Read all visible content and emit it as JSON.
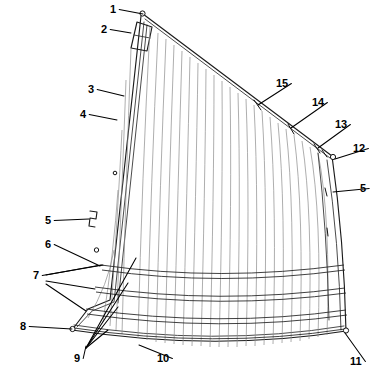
{
  "figure": {
    "kind": "patent-line-drawing",
    "background_color": "#ffffff",
    "line_color": "#1a1a1a",
    "panel_color": "#8b8b8b",
    "width": 387,
    "height": 384
  },
  "callouts": [
    {
      "id": "1",
      "label": "1",
      "x": 110,
      "y": 13,
      "target_x": 143,
      "target_y": 14,
      "anchor": "start"
    },
    {
      "id": "2",
      "label": "2",
      "x": 101,
      "y": 33,
      "target_x": 131,
      "target_y": 33,
      "anchor": "start"
    },
    {
      "id": "3",
      "label": "3",
      "x": 88,
      "y": 93,
      "target_x": 124,
      "target_y": 96,
      "anchor": "start"
    },
    {
      "id": "4",
      "label": "4",
      "x": 80,
      "y": 118,
      "target_x": 117,
      "target_y": 120,
      "anchor": "start"
    },
    {
      "id": "5a",
      "label": "5",
      "x": 45,
      "y": 224,
      "target_x": 89,
      "target_y": 219,
      "anchor": "start"
    },
    {
      "id": "6",
      "label": "6",
      "x": 45,
      "y": 248,
      "target_x": 100,
      "target_y": 266,
      "anchor": "start"
    },
    {
      "id": "7",
      "label": "7",
      "x": 33,
      "y": 279,
      "target_x": 103,
      "target_y": 265,
      "anchor": "start"
    },
    {
      "id": "8",
      "label": "8",
      "x": 20,
      "y": 330,
      "target_x": 72,
      "target_y": 329,
      "anchor": "start"
    },
    {
      "id": "9",
      "label": "9",
      "x": 74,
      "y": 362,
      "target_x": 86,
      "target_y": 346,
      "anchor": "start"
    },
    {
      "id": "10",
      "label": "10",
      "x": 157,
      "y": 362,
      "target_x": 139,
      "target_y": 345,
      "anchor": "start"
    },
    {
      "id": "11",
      "label": "11",
      "x": 350,
      "y": 365,
      "target_x": 345,
      "target_y": 333,
      "anchor": "start"
    },
    {
      "id": "12",
      "label": "12",
      "x": 353,
      "y": 152,
      "target_x": 335,
      "target_y": 159,
      "anchor": "start"
    },
    {
      "id": "13",
      "label": "13",
      "x": 335,
      "y": 128,
      "target_x": 318,
      "target_y": 148,
      "anchor": "start"
    },
    {
      "id": "14",
      "label": "14",
      "x": 312,
      "y": 106,
      "target_x": 291,
      "target_y": 128,
      "anchor": "start"
    },
    {
      "id": "15",
      "label": "15",
      "x": 276,
      "y": 87,
      "target_x": 258,
      "target_y": 105,
      "anchor": "start"
    },
    {
      "id": "5b",
      "label": "5",
      "x": 360,
      "y": 192,
      "target_x": 333,
      "target_y": 192,
      "anchor": "start"
    }
  ],
  "reference_numbers": [
    "1",
    "2",
    "3",
    "4",
    "5",
    "6",
    "7",
    "8",
    "9",
    "10",
    "11",
    "12",
    "13",
    "14",
    "15"
  ],
  "geometry": {
    "head_point": [
      143,
      14
    ],
    "peak_point": [
      332,
      156
    ],
    "clew_point": [
      346,
      331
    ],
    "tack_point": [
      72,
      330
    ],
    "luff_top": [
      141,
      16
    ],
    "luff_bottom": [
      110,
      300
    ],
    "panel_count": 27,
    "batten_count": 4
  },
  "chart_data": {
    "type": "table",
    "categories": [
      "1",
      "2",
      "3",
      "4",
      "5",
      "6",
      "7",
      "8",
      "9",
      "10",
      "11",
      "12",
      "13",
      "14",
      "15"
    ],
    "values": [
      1,
      2,
      3,
      4,
      5,
      6,
      7,
      8,
      9,
      10,
      11,
      12,
      13,
      14,
      15
    ]
  }
}
